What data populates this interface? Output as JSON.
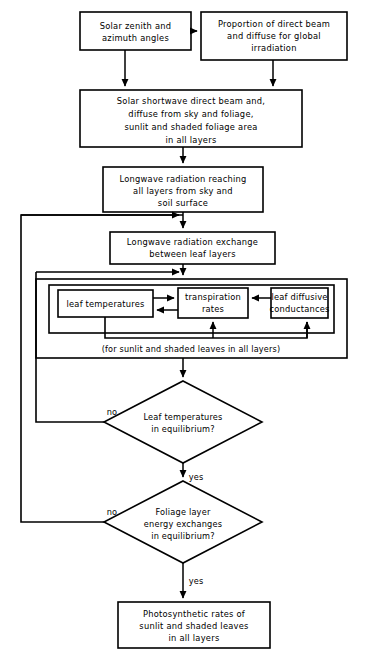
{
  "diagram": {
    "line_color": "#000000",
    "background_color": "#ffffff",
    "nodes": {
      "solar_angles": {
        "lines": [
          "Solar zenith and",
          "azimuth angles"
        ]
      },
      "proportion_beam": {
        "lines": [
          "Proportion of direct beam",
          "and diffuse for global",
          "irradiation"
        ]
      },
      "shortwave": {
        "lines": [
          "Solar shortwave direct beam and,",
          "diffuse from sky and foliage,",
          "sunlit and shaded foliage area",
          "in all layers"
        ]
      },
      "longwave_reaching": {
        "lines": [
          "Longwave radiation reaching",
          "all layers from sky and",
          "soil surface"
        ]
      },
      "longwave_exchange": {
        "lines": [
          "Longwave radiation exchange",
          "between leaf layers"
        ]
      },
      "leaf_temperatures": {
        "lines": [
          "leaf temperatures"
        ]
      },
      "transpiration_rates": {
        "lines": [
          "transpiration",
          "rates"
        ]
      },
      "leaf_diffusive": {
        "lines": [
          "leaf diffusive",
          "conductances"
        ]
      },
      "sunlit_shaded_note": {
        "lines": [
          "(for sunlit and shaded leaves in all layers)"
        ]
      },
      "photosynthetic": {
        "lines": [
          "Photosynthetic rates of",
          "sunlit and shaded leaves",
          "in all layers"
        ]
      }
    },
    "decisions": {
      "leaf_temp_equilibrium": {
        "lines": [
          "Leaf temperatures",
          "in equilibrium?"
        ],
        "no_label": "no",
        "yes_label": "yes"
      },
      "foliage_energy_equilibrium": {
        "lines": [
          "Foliage layer",
          "energy exchanges",
          "in equilibrium?"
        ],
        "no_label": "no",
        "yes_label": "yes"
      }
    }
  }
}
